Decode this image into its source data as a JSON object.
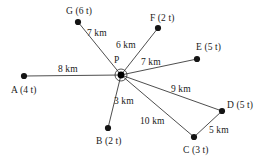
{
  "diagram": {
    "background_color": "#ffffff",
    "line_color": "#3a3a3a",
    "node_color": "#141414",
    "text_color": "#1a1a1a",
    "hub": {
      "id": "P",
      "label": "P",
      "x": 121,
      "y": 75,
      "label_x": 114,
      "label_y": 55
    },
    "nodes": [
      {
        "id": "A",
        "label": "A (4 t)",
        "x": 24,
        "y": 76,
        "label_x": 11,
        "label_y": 85
      },
      {
        "id": "B",
        "label": "B (2 t)",
        "x": 108,
        "y": 128,
        "label_x": 96,
        "label_y": 136
      },
      {
        "id": "C",
        "label": "C (3 t)",
        "x": 194,
        "y": 137,
        "label_x": 183,
        "label_y": 145
      },
      {
        "id": "D",
        "label": "D (5 t)",
        "x": 222,
        "y": 111,
        "label_x": 227,
        "label_y": 100
      },
      {
        "id": "E",
        "label": "E (5 t)",
        "x": 197,
        "y": 59,
        "label_x": 196,
        "label_y": 42
      },
      {
        "id": "F",
        "label": "F (2 t)",
        "x": 158,
        "y": 28,
        "label_x": 150,
        "label_y": 13
      },
      {
        "id": "G",
        "label": "G (6 t)",
        "x": 78,
        "y": 22,
        "label_x": 66,
        "label_y": 6
      }
    ],
    "edges": [
      {
        "id": "P-A",
        "from": "P",
        "to": "A",
        "weight": "8 km",
        "label_x": 58,
        "label_y": 64
      },
      {
        "id": "P-G",
        "from": "P",
        "to": "G",
        "weight": "7 km",
        "label_x": 87,
        "label_y": 28
      },
      {
        "id": "P-F",
        "from": "P",
        "to": "F",
        "weight": "6 km",
        "label_x": 116,
        "label_y": 40
      },
      {
        "id": "P-E",
        "from": "P",
        "to": "E",
        "weight": "7 km",
        "label_x": 141,
        "label_y": 57
      },
      {
        "id": "P-D",
        "from": "P",
        "to": "D",
        "weight": "9 km",
        "label_x": 171,
        "label_y": 84
      },
      {
        "id": "P-C",
        "from": "P",
        "to": "C",
        "weight": "10 km",
        "label_x": 140,
        "label_y": 116
      },
      {
        "id": "P-B",
        "from": "P",
        "to": "B",
        "weight": "3 km",
        "label_x": 114,
        "label_y": 96
      },
      {
        "id": "C-D",
        "from": "C",
        "to": "D",
        "weight": "5 km",
        "label_x": 209,
        "label_y": 125
      }
    ]
  }
}
